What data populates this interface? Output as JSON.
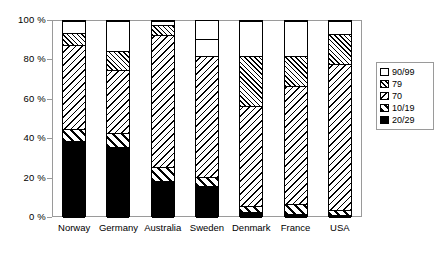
{
  "chart_data": {
    "type": "bar",
    "subtype": "stacked-percent",
    "title": "",
    "subtitle": "",
    "xlabel": "",
    "ylabel": "",
    "ylim": [
      0,
      100
    ],
    "yticks": [
      0,
      20,
      40,
      60,
      80,
      100
    ],
    "ytick_labels": [
      "0 %",
      "20 %",
      "40 %",
      "60 %",
      "80 %",
      "100 %"
    ],
    "grid": false,
    "legend_position": "right",
    "categories": [
      "Norway",
      "Germany",
      "Australia",
      "Sweden",
      "Denmark",
      "France",
      "USA"
    ],
    "series": [
      {
        "name": "20/29",
        "pattern": "solid-black",
        "values": [
          39,
          36,
          19,
          16,
          3,
          2,
          1.5
        ]
      },
      {
        "name": "10/19",
        "pattern": "wide-diagonal-stripe",
        "values": [
          6,
          7,
          7,
          5,
          3,
          5,
          2.5
        ]
      },
      {
        "name": "70",
        "pattern": "medium-diagonal-stripe",
        "values": [
          43,
          32,
          67,
          61,
          51,
          60,
          74
        ]
      },
      {
        "name": "79",
        "pattern": "dense-diagonal-stripe",
        "values": [
          6,
          10,
          5,
          0,
          25,
          15,
          15.5
        ]
      },
      {
        "name": "90/99",
        "pattern": "white",
        "values": [
          6,
          15,
          2,
          9,
          18,
          18,
          6.5
        ]
      }
    ],
    "stack_tops": {
      "Norway": [
        39,
        45,
        88,
        94,
        100
      ],
      "Germany": [
        36,
        43,
        75,
        85,
        100
      ],
      "Australia": [
        19,
        26,
        93,
        98,
        100
      ],
      "Sweden": [
        16,
        21,
        82,
        91,
        100
      ],
      "Denmark": [
        3,
        6,
        57,
        82,
        100
      ],
      "France": [
        2,
        7,
        67,
        82,
        100
      ],
      "USA": [
        1.5,
        4,
        78,
        93.5,
        100
      ]
    }
  },
  "legend": {
    "entries": [
      {
        "label": "90/99",
        "pattern": "white"
      },
      {
        "label": "79",
        "pattern": "dense-diagonal-stripe"
      },
      {
        "label": "70",
        "pattern": "medium-diagonal-stripe"
      },
      {
        "label": "10/19",
        "pattern": "wide-diagonal-stripe"
      },
      {
        "label": "20/29",
        "pattern": "solid-black"
      }
    ]
  },
  "colors": {
    "background": "#ffffff",
    "foreground": "#000000",
    "frame": "#9a9a9a",
    "gridline": "#c8c8c8"
  }
}
